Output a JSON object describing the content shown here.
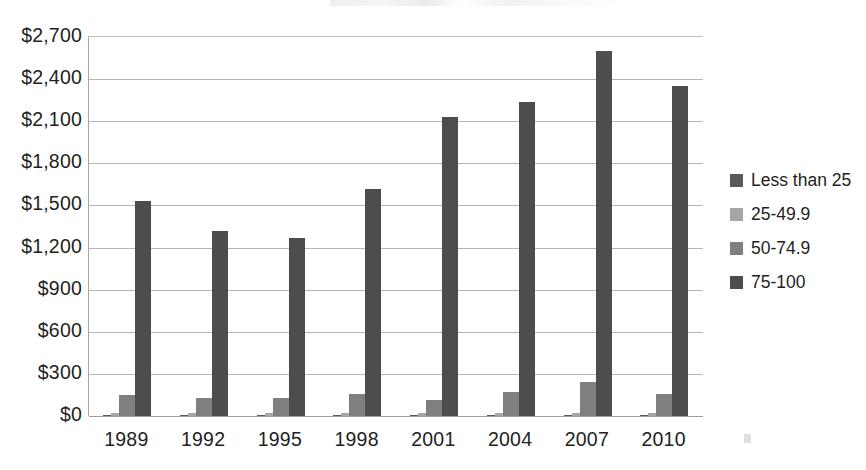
{
  "chart_data": {
    "type": "bar",
    "title": "",
    "xlabel": "",
    "ylabel": "",
    "categories": [
      "1989",
      "1992",
      "1995",
      "1998",
      "2001",
      "2004",
      "2007",
      "2010"
    ],
    "series": [
      {
        "name": "Less than 25",
        "color": "#595959",
        "values": [
          8,
          8,
          6,
          6,
          6,
          6,
          6,
          6
        ]
      },
      {
        "name": "25-49.9",
        "color": "#a6a6a6",
        "values": [
          22,
          20,
          18,
          18,
          18,
          20,
          22,
          20
        ]
      },
      {
        "name": "50-74.9",
        "color": "#7f7f7f",
        "values": [
          148,
          130,
          130,
          160,
          115,
          170,
          245,
          155
        ]
      },
      {
        "name": "75-100",
        "color": "#4d4d4d",
        "values": [
          1530,
          1320,
          1270,
          1620,
          2130,
          2240,
          2600,
          2350
        ]
      }
    ],
    "ylim": [
      0,
      2700
    ],
    "ytick_values": [
      0,
      300,
      600,
      900,
      1200,
      1500,
      1800,
      2100,
      2400,
      2700
    ],
    "ytick_labels": [
      "$0",
      "$300",
      "$600",
      "$900",
      "$1,200",
      "$1,500",
      "$1,800",
      "$2,100",
      "$2,400",
      "$2,700"
    ],
    "grid": true,
    "grid_axis": "y",
    "legend_position": "right"
  },
  "legend": {
    "items": [
      {
        "label": "Less than 25",
        "color": "#595959"
      },
      {
        "label": "25-49.9",
        "color": "#a6a6a6"
      },
      {
        "label": "50-74.9",
        "color": "#7f7f7f"
      },
      {
        "label": "75-100",
        "color": "#4d4d4d"
      }
    ]
  }
}
